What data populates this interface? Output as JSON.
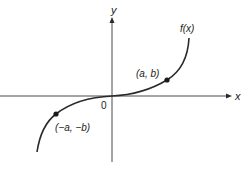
{
  "diagram": {
    "type": "function-graph",
    "axes": {
      "x_label": "x",
      "y_label": "y",
      "origin_label": "0"
    },
    "curve": {
      "label": "f(x)"
    },
    "points": [
      {
        "label": "(a, b)",
        "x_px": 167,
        "y_px": 80
      },
      {
        "label": "(−a, −b)",
        "x_px": 56,
        "y_px": 114
      }
    ],
    "colors": {
      "stroke": "#2a2a2a",
      "background": "#ffffff"
    }
  }
}
